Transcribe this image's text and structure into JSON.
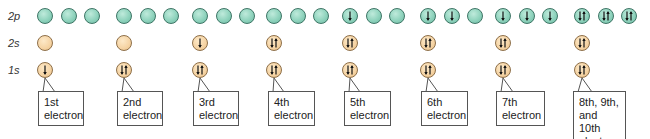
{
  "row_labels": {
    "p2": "2p",
    "s2": "2s",
    "s1": "1s"
  },
  "colors": {
    "p_orbital": "#8fd3bd",
    "s_orbital": "#f5d3a3"
  },
  "stages": [
    {
      "label_line1": "1st",
      "label_line2": "electron",
      "label_line3": "",
      "s1": "down",
      "s2": "empty",
      "p2": [
        "empty",
        "empty",
        "empty"
      ]
    },
    {
      "label_line1": "2nd",
      "label_line2": "electron",
      "label_line3": "",
      "s1": "pair",
      "s2": "empty",
      "p2": [
        "empty",
        "empty",
        "empty"
      ]
    },
    {
      "label_line1": "3rd",
      "label_line2": "electron",
      "label_line3": "",
      "s1": "pair",
      "s2": "down",
      "p2": [
        "empty",
        "empty",
        "empty"
      ]
    },
    {
      "label_line1": "4th",
      "label_line2": "electron",
      "label_line3": "",
      "s1": "pair",
      "s2": "pair",
      "p2": [
        "empty",
        "empty",
        "empty"
      ]
    },
    {
      "label_line1": "5th",
      "label_line2": "electron",
      "label_line3": "",
      "s1": "pair",
      "s2": "pair",
      "p2": [
        "down",
        "empty",
        "empty"
      ]
    },
    {
      "label_line1": "6th",
      "label_line2": "electron",
      "label_line3": "",
      "s1": "pair",
      "s2": "pair",
      "p2": [
        "down",
        "down",
        "empty"
      ]
    },
    {
      "label_line1": "7th",
      "label_line2": "electron",
      "label_line3": "",
      "s1": "pair",
      "s2": "pair",
      "p2": [
        "down",
        "down",
        "down"
      ]
    },
    {
      "label_line1": "8th, 9th,",
      "label_line2": "and 10th",
      "label_line3": "electrons",
      "s1": "pair",
      "s2": "pair",
      "p2": [
        "pair",
        "pair",
        "pair"
      ]
    }
  ]
}
